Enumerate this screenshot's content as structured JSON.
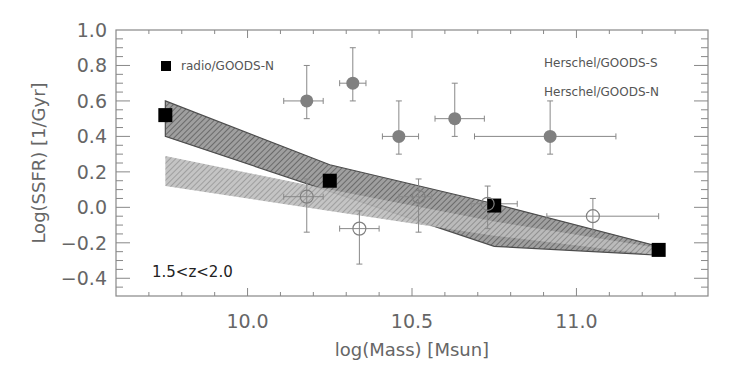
{
  "chart_data": {
    "type": "scatter",
    "title": "",
    "xlabel": "log(Mass) [Msun]",
    "ylabel": "Log(SSFR) [1/Gyr]",
    "xlim": [
      9.6,
      11.4
    ],
    "ylim": [
      -0.5,
      1.0
    ],
    "xticks": [
      10.0,
      10.5,
      11.0
    ],
    "xtick_labels": [
      "10.0",
      "10.5",
      "11.0"
    ],
    "xminor_step": 0.1,
    "yticks": [
      -0.4,
      -0.2,
      0.0,
      0.2,
      0.4,
      0.6,
      0.8,
      1.0
    ],
    "ytick_labels": [
      "−0.4",
      "−0.2",
      "0.0",
      "0.2",
      "0.4",
      "0.6",
      "0.8",
      "1.0"
    ],
    "yminor_step": 0.05,
    "grid": false,
    "annotation": "1.5<z<2.0",
    "legend": [
      {
        "label": "radio/GOODS-N",
        "marker": "filled-square",
        "color": "#000000"
      },
      {
        "label": "Herschel/GOODS-S",
        "marker": "none",
        "color": "#555555"
      },
      {
        "label": "Herschel/GOODS-N",
        "marker": "none",
        "color": "#555555"
      }
    ],
    "legend_placement": "top (left and right)",
    "series": [
      {
        "name": "radio/GOODS-N",
        "marker": "filled-square",
        "color": "#000000",
        "points": [
          {
            "x": 9.75,
            "y": 0.52
          },
          {
            "x": 10.25,
            "y": 0.15
          },
          {
            "x": 10.75,
            "y": 0.01
          },
          {
            "x": 11.25,
            "y": -0.24
          }
        ]
      },
      {
        "name": "Herschel/GOODS-S",
        "marker": "filled-circle",
        "color": "#808080",
        "points": [
          {
            "x": 10.18,
            "y": 0.6,
            "xerr": [
              10.11,
              10.23
            ],
            "yerr": [
              0.5,
              0.8
            ]
          },
          {
            "x": 10.32,
            "y": 0.7,
            "xerr": [
              10.28,
              10.36
            ],
            "yerr": [
              0.6,
              0.9
            ]
          },
          {
            "x": 10.46,
            "y": 0.4,
            "xerr": [
              10.41,
              10.52
            ],
            "yerr": [
              0.3,
              0.6
            ]
          },
          {
            "x": 10.63,
            "y": 0.5,
            "xerr": [
              10.57,
              10.72
            ],
            "yerr": [
              0.4,
              0.7
            ]
          },
          {
            "x": 10.92,
            "y": 0.4,
            "xerr": [
              10.69,
              11.12
            ],
            "yerr": [
              0.3,
              0.6
            ]
          }
        ]
      },
      {
        "name": "Herschel/GOODS-N",
        "marker": "open-circle",
        "color": "#808080",
        "points": [
          {
            "x": 10.18,
            "y": 0.06,
            "xerr": [
              10.11,
              10.23
            ],
            "yerr": [
              -0.14,
              0.16
            ]
          },
          {
            "x": 10.34,
            "y": -0.12,
            "xerr": [
              10.28,
              10.4
            ],
            "yerr": [
              -0.32,
              -0.02
            ]
          },
          {
            "x": 10.52,
            "y": 0.06,
            "xerr": [
              10.46,
              10.56
            ],
            "yerr": [
              -0.14,
              0.16
            ]
          },
          {
            "x": 10.73,
            "y": 0.02,
            "xerr": [
              10.68,
              10.82
            ],
            "yerr": [
              -0.12,
              0.12
            ]
          },
          {
            "x": 11.05,
            "y": -0.05,
            "xerr": [
              10.91,
              11.25
            ],
            "yerr": [
              -0.15,
              0.05
            ]
          }
        ]
      }
    ],
    "bands": [
      {
        "name": "upper-band",
        "fill": "#8a8a8a",
        "edge": "#333333",
        "upper": [
          {
            "x": 9.75,
            "y": 0.6
          },
          {
            "x": 10.25,
            "y": 0.24
          },
          {
            "x": 10.75,
            "y": 0.02
          },
          {
            "x": 11.25,
            "y": -0.22
          }
        ],
        "lower": [
          {
            "x": 9.75,
            "y": 0.4
          },
          {
            "x": 10.25,
            "y": 0.09
          },
          {
            "x": 10.75,
            "y": -0.22
          },
          {
            "x": 11.25,
            "y": -0.27
          }
        ]
      },
      {
        "name": "lower-band",
        "fill": "#a8a8a8",
        "edge": "#a8a8a8",
        "upper": [
          {
            "x": 9.75,
            "y": 0.29
          },
          {
            "x": 10.25,
            "y": 0.1
          },
          {
            "x": 10.75,
            "y": -0.08
          },
          {
            "x": 11.25,
            "y": -0.23
          }
        ],
        "lower": [
          {
            "x": 9.75,
            "y": 0.12
          },
          {
            "x": 10.25,
            "y": -0.02
          },
          {
            "x": 10.75,
            "y": -0.16
          },
          {
            "x": 11.25,
            "y": -0.27
          }
        ]
      }
    ]
  }
}
